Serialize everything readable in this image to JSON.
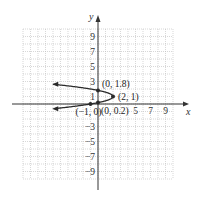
{
  "chart_data": {
    "type": "line",
    "title": "",
    "xlabel": "x",
    "ylabel": "y",
    "xlim": [
      -10,
      10
    ],
    "ylim": [
      -10,
      10
    ],
    "grid": true,
    "x_tick_labels": [
      "5",
      "7",
      "9"
    ],
    "y_tick_labels": [
      "9",
      "7",
      "5",
      "3",
      "1",
      "-3",
      "-5",
      "-7",
      "-9"
    ],
    "curve": {
      "shape": "parabola opening left",
      "vertex": [
        2,
        1
      ],
      "arrows": "both ends"
    },
    "points": [
      {
        "x": 0,
        "y": 1.8,
        "label": "(0, 1.8)"
      },
      {
        "x": 2,
        "y": 1,
        "label": "(2, 1)"
      },
      {
        "x": -1,
        "y": 0,
        "label": "(−1, 0)"
      },
      {
        "x": 0,
        "y": 0.2,
        "label": "(0, 0.2)"
      }
    ]
  },
  "colors": {
    "grid": "#bdbdbd",
    "axis": "#333333",
    "curve": "#2a2a2a"
  }
}
